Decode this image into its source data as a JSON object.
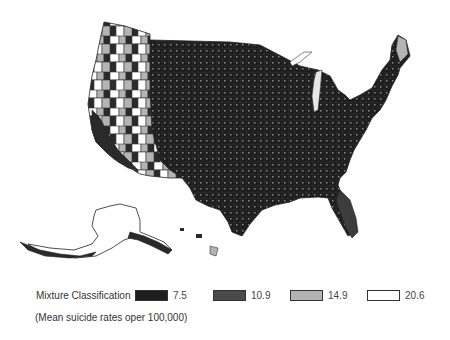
{
  "map": {
    "subject": "Mean suicide rates by US county (mixture classification)",
    "regions_shown": [
      "Contiguous United States",
      "Alaska",
      "Hawaii"
    ],
    "colors": {
      "class_1": "#1e1e1e",
      "class_2": "#4a4a4a",
      "class_3": "#b4b4b4",
      "class_4": "#ffffff",
      "border": "#333333"
    }
  },
  "legend": {
    "title": "Mixture Classification",
    "subtitle": "(Mean suicide rates oper 100,000)",
    "items": [
      {
        "label": "7.5",
        "color": "#1e1e1e"
      },
      {
        "label": "10.9",
        "color": "#4a4a4a"
      },
      {
        "label": "14.9",
        "color": "#b4b4b4"
      },
      {
        "label": "20.6",
        "color": "#ffffff"
      }
    ]
  }
}
